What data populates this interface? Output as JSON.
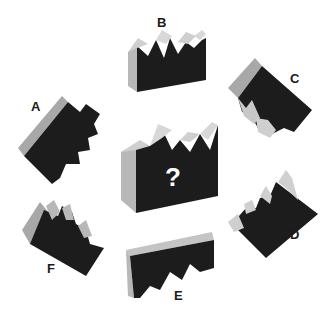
{
  "puzzle": {
    "center_mark": "?",
    "options": [
      {
        "label": "A"
      },
      {
        "label": "B"
      },
      {
        "label": "C"
      },
      {
        "label": "D"
      },
      {
        "label": "E"
      },
      {
        "label": "F"
      }
    ]
  },
  "colors": {
    "dark_face": "#1c1c1c",
    "light_face": "#a8a8a8",
    "highlight": "#d4d4d4",
    "background": "#ffffff"
  }
}
